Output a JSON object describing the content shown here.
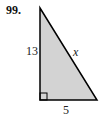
{
  "problem": {
    "number": "99.",
    "figure": "right-triangle",
    "labels": {
      "vertical_leg": "13",
      "hypotenuse": "x",
      "horizontal_leg": "5"
    },
    "fill_color": "#d3d3d3",
    "stroke_color": "#000000"
  }
}
